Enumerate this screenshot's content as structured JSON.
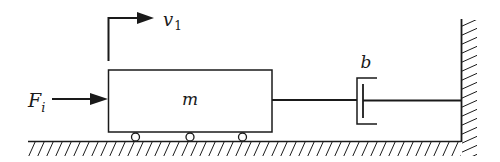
{
  "diagram": {
    "type": "mass-damper system",
    "colors": {
      "ink": "#1a1a1a",
      "background": "#ffffff"
    },
    "labels": {
      "velocity": "v",
      "velocity_sub": "1",
      "force": "F",
      "force_sub": "i",
      "mass": "m",
      "damper": "b"
    },
    "components": [
      {
        "id": "mass",
        "label": "m",
        "kind": "block on rollers",
        "wheels": 3
      },
      {
        "id": "damper",
        "label": "b",
        "kind": "dashpot"
      },
      {
        "id": "wall",
        "kind": "fixed wall (hatched)"
      },
      {
        "id": "ground",
        "kind": "ground (hatched)"
      },
      {
        "id": "input-force",
        "label": "F_i",
        "kind": "arrow into mass"
      },
      {
        "id": "velocity",
        "label": "v_1",
        "kind": "bent arrow above mass"
      }
    ]
  }
}
